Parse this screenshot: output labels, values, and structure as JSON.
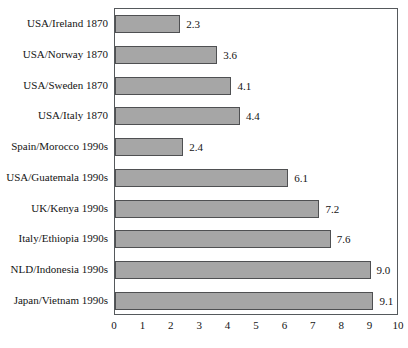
{
  "chart_data": {
    "type": "bar",
    "orientation": "horizontal",
    "title": "",
    "subtitle": "",
    "xlabel": "",
    "ylabel": "",
    "xlim": [
      0,
      10
    ],
    "xticks": [
      "0",
      "1",
      "2",
      "3",
      "4",
      "5",
      "6",
      "7",
      "8",
      "9",
      "10"
    ],
    "grid": false,
    "legend": null,
    "bar_color": "#a6a6a6",
    "bar_edge_color": "#4f5052",
    "axis_color": "#55595c",
    "categories": [
      "USA/Ireland 1870",
      "USA/Norway 1870",
      "USA/Sweden 1870",
      "USA/Italy 1870",
      "Spain/Morocco 1990s",
      "USA/Guatemala 1990s",
      "UK/Kenya 1990s",
      "Italy/Ethiopia 1990s",
      "NLD/Indonesia 1990s",
      "Japan/Vietnam 1990s"
    ],
    "values": [
      2.3,
      3.6,
      4.1,
      4.4,
      2.4,
      6.1,
      7.2,
      7.6,
      9.0,
      9.1
    ],
    "value_labels": [
      "2.3",
      "3.6",
      "4.1",
      "4.4",
      "2.4",
      "6.1",
      "7.2",
      "7.6",
      "9.0",
      "9.1"
    ]
  }
}
